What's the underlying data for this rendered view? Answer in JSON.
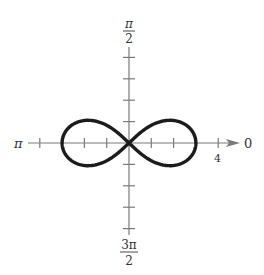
{
  "chart_data": {
    "type": "line",
    "subtype": "polar",
    "title": "",
    "equation": "r^2 = 9 cos(2θ)",
    "angle_labels": {
      "right": "0",
      "top_num": "π",
      "top_den": "2",
      "left": "π",
      "bottom_num": "3π",
      "bottom_den": "2"
    },
    "radial_tick_label": "4",
    "radial_tick_label_value": 4,
    "radial_ticks": [
      1,
      2,
      3,
      4
    ],
    "axis_range": {
      "r": [
        -4,
        4
      ]
    },
    "series": [
      {
        "name": "lemniscate",
        "a": 3,
        "max_r": 3,
        "intercepts_polar_axis": [
          -3,
          0,
          3
        ]
      }
    ],
    "grid": false,
    "legend": null,
    "colors": {
      "curve": "#1c1c1c",
      "axis": "#7a7a7a",
      "text": "#333333"
    }
  }
}
